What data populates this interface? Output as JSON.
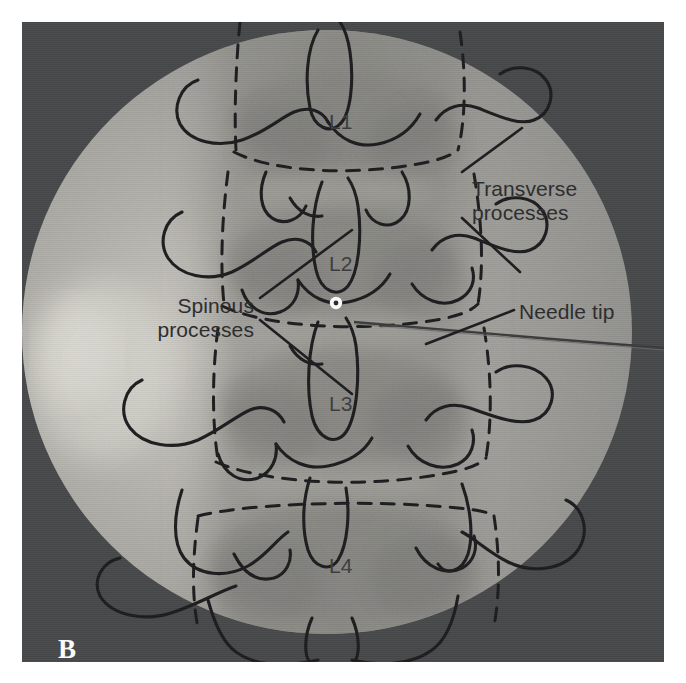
{
  "figure": {
    "panel_letter": "B",
    "modality": "fluoroscopy",
    "region": "lumbar spine",
    "view": "anteroposterior"
  },
  "annotations": [
    {
      "id": "transverse-processes",
      "label": "Transverse\nprocesses",
      "x": 470,
      "y": 168,
      "leaders": 2
    },
    {
      "id": "spinous-processes",
      "label": "Spinous\nprocesses",
      "x": 118,
      "y": 285,
      "leaders": 2
    },
    {
      "id": "needle-tip",
      "label": "Needle tip",
      "x": 519,
      "y": 291,
      "leaders": 1
    }
  ],
  "vertebrae": [
    {
      "id": "L1",
      "label": "L1",
      "x": 329,
      "y": 101
    },
    {
      "id": "L2",
      "label": "L2",
      "x": 329,
      "y": 243
    },
    {
      "id": "L3",
      "label": "L3",
      "x": 329,
      "y": 383
    },
    {
      "id": "L4",
      "label": "L4",
      "x": 329,
      "y": 545
    }
  ],
  "markers": {
    "needle_tip_point": {
      "x": 336,
      "y": 303,
      "color": "#ffffff"
    },
    "needle_shaft": {
      "from_x": 336,
      "from_y": 303,
      "to_x": 664,
      "to_y": 327
    }
  },
  "colors": {
    "page_background": "#ffffff",
    "scan_background": "#46484a",
    "fluoro_field": "#9a9a98",
    "fluoro_field_bright": "#c9c8c2",
    "tracing_line": "#1e1e20",
    "label_text": "#2b2b2d",
    "panel_letter": "#ffffff"
  },
  "tracing": {
    "solid_outline_meaning": "transverse processes, pedicles, articular processes",
    "dashed_outline_meaning": "vertebral body endplates and lateral borders"
  }
}
